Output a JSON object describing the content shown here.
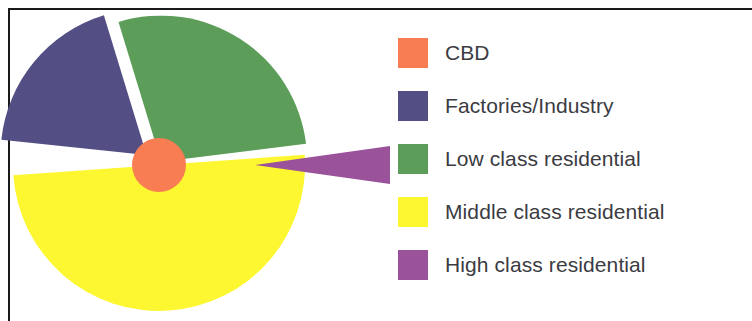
{
  "figure": {
    "type": "exploded-pie-chart",
    "background": "#ffffff",
    "frame_color": "#1a1a1a"
  },
  "legend": {
    "position": "right",
    "text_color": "#3b3b42",
    "items": [
      {
        "label": "CBD",
        "color": "#f97d53",
        "swatch_name": "legend-swatch-cbd"
      },
      {
        "label": "Factories/Industry",
        "color": "#534f85",
        "swatch_name": "legend-swatch-factories"
      },
      {
        "label": "Low class residential",
        "color": "#5d9d5a",
        "swatch_name": "legend-swatch-low-class"
      },
      {
        "label": "Middle class residential",
        "color": "#fcf731",
        "swatch_name": "legend-swatch-middle-class"
      },
      {
        "label": "High class residential",
        "color": "#9a539b",
        "swatch_name": "legend-swatch-high-class"
      }
    ]
  },
  "chart_data": {
    "type": "pie",
    "title": "",
    "xlabel": "",
    "ylabel": "",
    "exploded": true,
    "labels": [
      "CBD",
      "Factories/Industry",
      "Low class residential",
      "Middle class residential",
      "High class residential"
    ],
    "colors": [
      "#f97d53",
      "#534f85",
      "#5d9d5a",
      "#fcf731",
      "#9a539b"
    ],
    "values": [
      4,
      18,
      28,
      42,
      8
    ],
    "units": "percent",
    "slices": [
      {
        "name": "CBD",
        "color": "#f97d53",
        "value": 4,
        "render": "center-circle",
        "center_x": 159,
        "center_y": 165,
        "radius": 27
      },
      {
        "name": "Factories/Industry",
        "color": "#534f85",
        "value": 18,
        "start_angle": 186,
        "end_angle": 253,
        "explode_offset": 16,
        "explode_direction_deg": 219
      },
      {
        "name": "Low class residential",
        "color": "#5d9d5a",
        "value": 28,
        "start_angle": 253,
        "end_angle": 353,
        "explode_offset": 4,
        "explode_direction_deg": 303
      },
      {
        "name": "Middle class residential",
        "color": "#fcf731",
        "value": 42,
        "start_angle": 356,
        "end_angle": 176,
        "explode_offset": 0,
        "explode_direction_deg": 86
      },
      {
        "name": "High class residential",
        "color": "#9a539b",
        "value": 8,
        "start_angle": -8,
        "end_angle": 8,
        "explode_offset": 96,
        "explode_direction_deg": 0
      }
    ],
    "geometry": {
      "center_x": 159,
      "center_y": 165,
      "radius": 146,
      "cropped_edges": [
        "left",
        "bottom"
      ]
    },
    "grid": false,
    "legend_position": "right"
  }
}
